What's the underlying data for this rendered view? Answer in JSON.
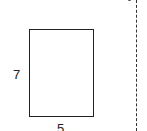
{
  "diagram": {
    "shape": "rectangle",
    "height_label": "7",
    "width_label": "5",
    "divider": "dashed-vertical-line"
  },
  "colors": {
    "stroke": "#222222",
    "background": "#ffffff"
  }
}
